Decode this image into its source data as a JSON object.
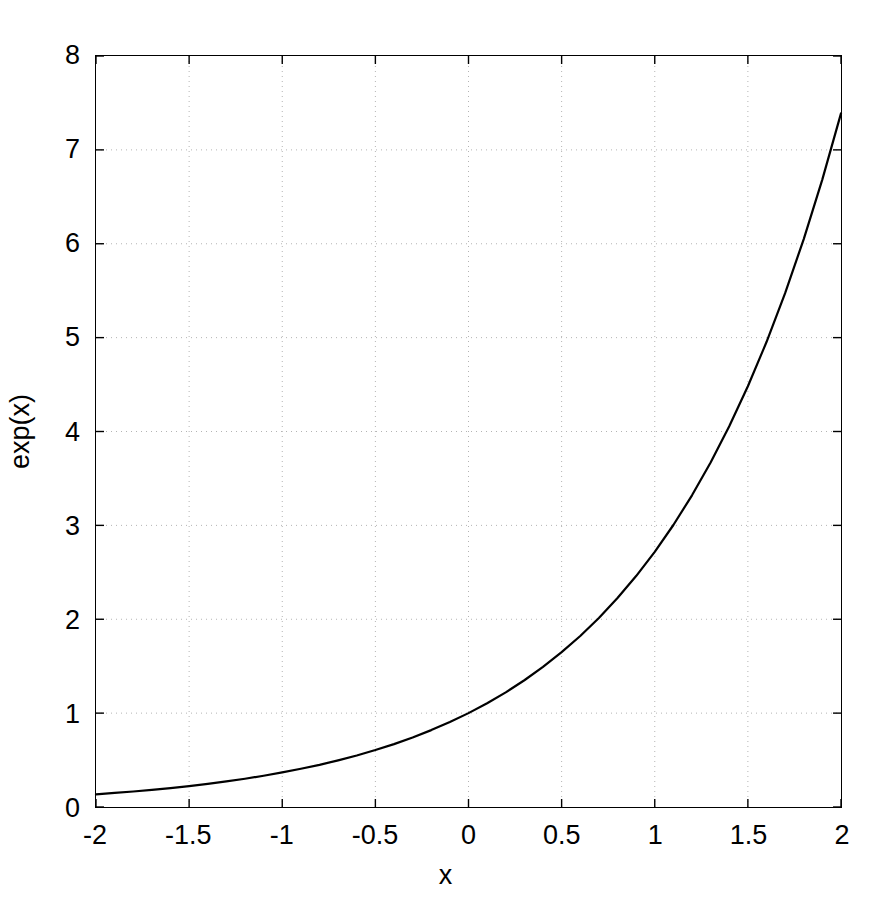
{
  "chart_data": {
    "type": "line",
    "title": "",
    "xlabel": "x",
    "ylabel": "exp(x)",
    "xlim": [
      -2,
      2
    ],
    "ylim": [
      0,
      8
    ],
    "xticks": [
      -2,
      -1.5,
      -1,
      -0.5,
      0,
      0.5,
      1,
      1.5,
      2
    ],
    "yticks": [
      0,
      1,
      2,
      3,
      4,
      5,
      6,
      7,
      8
    ],
    "xtick_labels": [
      "-2",
      "-1.5",
      "-1",
      "-0.5",
      "0",
      "0.5",
      "1",
      "1.5",
      "2"
    ],
    "ytick_labels": [
      "0",
      "1",
      "2",
      "3",
      "4",
      "5",
      "6",
      "7",
      "8"
    ],
    "grid": true,
    "grid_style": "dotted",
    "grid_color": "#b4b4b4",
    "legend": null,
    "line_color": "#000000",
    "line_width": 2,
    "series": [
      {
        "name": "exp(x)",
        "x": [
          -2,
          -1.9,
          -1.8,
          -1.7,
          -1.6,
          -1.5,
          -1.4,
          -1.3,
          -1.2,
          -1.1,
          -1,
          -0.9,
          -0.8,
          -0.7,
          -0.6,
          -0.5,
          -0.4,
          -0.3,
          -0.2,
          -0.1,
          0,
          0.1,
          0.2,
          0.3,
          0.4,
          0.5,
          0.6,
          0.7,
          0.8,
          0.9,
          1,
          1.1,
          1.2,
          1.3,
          1.4,
          1.5,
          1.6,
          1.7,
          1.8,
          1.9,
          2
        ],
        "values": [
          0.135,
          0.15,
          0.165,
          0.183,
          0.202,
          0.223,
          0.247,
          0.273,
          0.301,
          0.333,
          0.368,
          0.407,
          0.449,
          0.497,
          0.549,
          0.607,
          0.67,
          0.741,
          0.819,
          0.905,
          1.0,
          1.105,
          1.221,
          1.35,
          1.492,
          1.649,
          1.822,
          2.014,
          2.226,
          2.46,
          2.718,
          3.004,
          3.32,
          3.669,
          4.055,
          4.482,
          4.953,
          5.474,
          6.05,
          6.686,
          7.389
        ]
      }
    ]
  },
  "axes": {
    "x_axis_title": "x",
    "y_axis_title": "exp(x)"
  }
}
